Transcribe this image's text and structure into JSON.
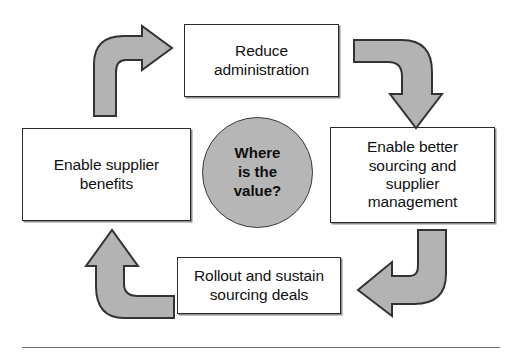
{
  "diagram": {
    "title": "Where is the value?",
    "type": "cycle-diagram",
    "center": {
      "label": "Where\nis the\nvalue?",
      "shape": "circle",
      "fill_color": "#b6b6b6",
      "border_color": "#3a3a3a"
    },
    "boxes": [
      {
        "id": "top",
        "position": "top",
        "label": "Reduce\nadministration",
        "fill_color": "#ffffff",
        "border_color": "#2b2b2b"
      },
      {
        "id": "right",
        "position": "right",
        "label": "Enable better\nsourcing and\nsupplier\nmanagement",
        "fill_color": "#ffffff",
        "border_color": "#2b2b2b"
      },
      {
        "id": "bottom",
        "position": "bottom",
        "label": "Rollout and sustain\nsourcing deals",
        "fill_color": "#ffffff",
        "border_color": "#2b2b2b"
      },
      {
        "id": "left",
        "position": "left",
        "label": "Enable supplier\nbenefits",
        "fill_color": "#ffffff",
        "border_color": "#2b2b2b"
      }
    ],
    "arrows": [
      {
        "id": "top-left",
        "name": "curved-arrow-up-right-icon",
        "from": "left",
        "to": "top",
        "direction": "up-then-right",
        "fill_color": "#b3b3b3"
      },
      {
        "id": "top-right",
        "name": "curved-arrow-right-down-icon",
        "from": "top",
        "to": "right",
        "direction": "right-then-down",
        "fill_color": "#b3b3b3"
      },
      {
        "id": "bottom-right",
        "name": "curved-arrow-down-left-icon",
        "from": "right",
        "to": "bottom",
        "direction": "down-then-left",
        "fill_color": "#b3b3b3"
      },
      {
        "id": "bottom-left",
        "name": "curved-arrow-left-up-icon",
        "from": "bottom",
        "to": "left",
        "direction": "left-then-up",
        "fill_color": "#b3b3b3"
      }
    ],
    "footer_rule": {
      "visible": true,
      "color": "#6f6f6f"
    }
  }
}
